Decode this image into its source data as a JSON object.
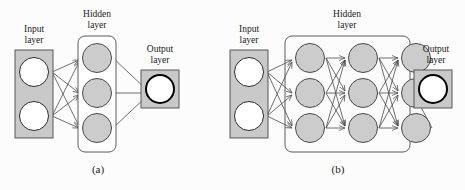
{
  "figure": {
    "background_color": "#fcfcfc",
    "width": 465,
    "height": 190,
    "stroke_color": "#4a4a4a",
    "node_fill_gray": "#cccccc",
    "node_fill_white": "#ffffff",
    "box_fill_gray": "#c9c9c9",
    "box_fill_white": "#ffffff",
    "output_node_stroke": "#000000"
  },
  "panels": [
    {
      "id": "a",
      "caption": "(a)",
      "labels": {
        "input": {
          "line1": "Input",
          "line2": "layer"
        },
        "hidden": {
          "line1": "Hidden",
          "line2": "layer"
        },
        "output": {
          "line1": "Output",
          "line2": "layer"
        }
      },
      "architecture": {
        "input_nodes": 2,
        "hidden_columns": 1,
        "hidden_nodes_per_column": 3,
        "output_nodes": 1
      }
    },
    {
      "id": "b",
      "caption": "(b)",
      "labels": {
        "input": {
          "line1": "Input",
          "line2": "layer"
        },
        "hidden": {
          "line1": "Hidden",
          "line2": "layer"
        },
        "output": {
          "line1": "Output",
          "line2": "layer"
        }
      },
      "architecture": {
        "input_nodes": 2,
        "hidden_columns": 3,
        "hidden_nodes_per_column": 3,
        "output_nodes": 1
      }
    }
  ]
}
